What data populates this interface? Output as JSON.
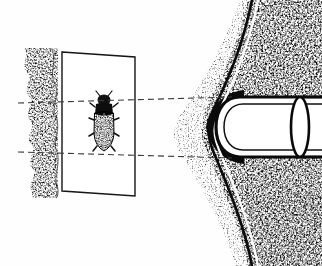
{
  "figure": {
    "kind": "scanned-line-engraving",
    "caption": "",
    "background_color": "#fefefe",
    "ink_color": "#121212",
    "stipple_color": "#2a2a2a",
    "dash_color": "#3a3a3a",
    "width": 322,
    "height": 266
  },
  "panels": {
    "left_substrate": {
      "name": "stippled-substrate-column",
      "x": 22,
      "y": 48,
      "width": 36,
      "height": 150,
      "texture": "coarse-stipple"
    },
    "perspective_plate": {
      "name": "perspective-plate",
      "corners": "62,52 135,57 135,196 62,191",
      "stroke_width": 1.4,
      "fill": "#ffffff"
    },
    "magnified_view": {
      "name": "magnified-cross-section",
      "x": 170,
      "y": 0,
      "width": 152,
      "height": 266,
      "texture": "dense-stipple-and-hatch"
    }
  },
  "specimen": {
    "name": "dark-specimen-figure",
    "center_x": 104,
    "center_y": 124,
    "width": 20,
    "height": 58,
    "segments": 7,
    "fill": "#0d0d0d"
  },
  "projectile": {
    "name": "bullet-body",
    "nose_x": 214,
    "tail_x": 322,
    "center_y": 127,
    "half_height": 30,
    "outline_width": 3.2,
    "inner_line_offset": 7,
    "end_ellipse_rx": 9,
    "end_ellipse_ry": 30
  },
  "guides": {
    "projection_lines": [
      {
        "name": "upper-projection-line",
        "x1": 18,
        "y1": 103,
        "x2": 232,
        "y2": 97
      },
      {
        "name": "lower-projection-line",
        "x1": 18,
        "y1": 152,
        "x2": 232,
        "y2": 158
      }
    ],
    "dash_pattern": "6,4",
    "dash_width": 1.1
  },
  "channel": {
    "name": "wound-channel-curve",
    "stroke_width": 2.6,
    "path": "M 252 0 C 244 40 232 72 216 104 C 206 126 206 136 216 158 C 232 196 246 232 252 266"
  },
  "labels": {
    "has_text": false,
    "text_items": []
  }
}
